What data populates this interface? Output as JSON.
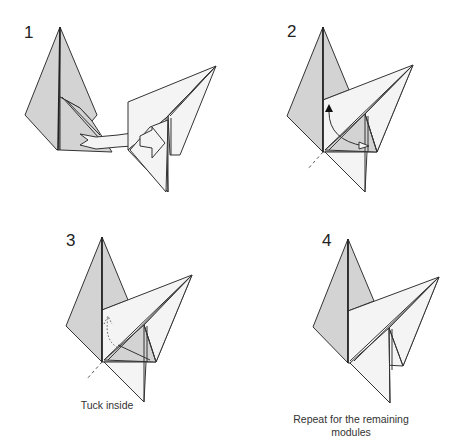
{
  "steps": [
    {
      "number": "1",
      "caption": ""
    },
    {
      "number": "2",
      "caption": ""
    },
    {
      "number": "3",
      "caption": "Tuck inside"
    },
    {
      "number": "4",
      "caption_line1": "Repeat for the remaining",
      "caption_line2": "modules"
    }
  ],
  "colors": {
    "paper_colored": "#d3d3d3",
    "paper_white": "#f4f4f4",
    "outline": "#333333",
    "background": "#ffffff"
  },
  "icons": {
    "insert-arrow": "hollow ribbon arrow",
    "fold-arrow": "curved arrow with filled head",
    "tuck-arrow": "dotted curved arrow"
  }
}
